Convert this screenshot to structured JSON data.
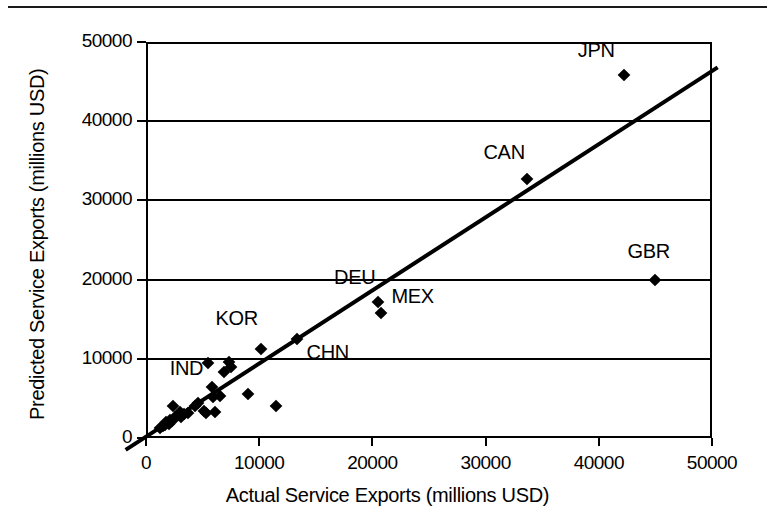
{
  "chart_data": {
    "type": "scatter",
    "title": "",
    "xlabel": "Actual Service Exports (millions USD)",
    "ylabel": "Predicted Service Exports (millions USD)",
    "xlim": [
      0,
      50000
    ],
    "ylim": [
      0,
      50000
    ],
    "xticks": [
      0,
      10000,
      20000,
      30000,
      40000,
      50000
    ],
    "yticks": [
      0,
      10000,
      20000,
      30000,
      40000,
      50000
    ],
    "xtick_labels": [
      "0",
      "10000",
      "20000",
      "30000",
      "40000",
      "50000"
    ],
    "ytick_labels": [
      "0",
      "10000",
      "20000",
      "30000",
      "40000",
      "50000"
    ],
    "grid": "horizontal",
    "legend": "none",
    "marker": "filled-diamond",
    "marker_color": "#000000",
    "fit_line": {
      "label": "identity/regression line",
      "color": "#000000",
      "width": 4,
      "x_start": -1800,
      "y_start": -1500,
      "x_end": 50500,
      "y_end": 46800
    },
    "labeled_points": [
      {
        "label": "JPN",
        "x": 42200,
        "y": 45800,
        "label_dx": -46,
        "label_dy": -24
      },
      {
        "label": "CAN",
        "x": 33700,
        "y": 32700,
        "label_dx": -44,
        "label_dy": -26
      },
      {
        "label": "GBR",
        "x": 45000,
        "y": 20000,
        "label_dx": -28,
        "label_dy": -28
      },
      {
        "label": "DEU",
        "x": 20500,
        "y": 17200,
        "label_dx": -44,
        "label_dy": -24
      },
      {
        "label": "MEX",
        "x": 20800,
        "y": 15800,
        "label_dx": 10,
        "label_dy": -16
      },
      {
        "label": "CHN",
        "x": 13300,
        "y": 12500,
        "label_dx": 10,
        "label_dy": 14
      },
      {
        "label": "KOR",
        "x": 10200,
        "y": 11200,
        "label_dx": -46,
        "label_dy": -30
      },
      {
        "label": "IND",
        "x": 5800,
        "y": 6500,
        "label_dx": -42,
        "label_dy": -18
      }
    ],
    "unlabeled_points": [
      {
        "x": 1200,
        "y": 1300
      },
      {
        "x": 1500,
        "y": 1500
      },
      {
        "x": 1700,
        "y": 1600
      },
      {
        "x": 1800,
        "y": 2000
      },
      {
        "x": 2000,
        "y": 1800
      },
      {
        "x": 2100,
        "y": 2300
      },
      {
        "x": 2300,
        "y": 2100
      },
      {
        "x": 2400,
        "y": 4000
      },
      {
        "x": 2600,
        "y": 2600
      },
      {
        "x": 2800,
        "y": 2900
      },
      {
        "x": 3000,
        "y": 3300
      },
      {
        "x": 3100,
        "y": 2700
      },
      {
        "x": 3400,
        "y": 3000
      },
      {
        "x": 3700,
        "y": 3100
      },
      {
        "x": 4300,
        "y": 4000
      },
      {
        "x": 4600,
        "y": 4400
      },
      {
        "x": 5100,
        "y": 3400
      },
      {
        "x": 5300,
        "y": 3200
      },
      {
        "x": 5500,
        "y": 9500
      },
      {
        "x": 5900,
        "y": 5200
      },
      {
        "x": 6100,
        "y": 3300
      },
      {
        "x": 6500,
        "y": 5300
      },
      {
        "x": 6900,
        "y": 8300
      },
      {
        "x": 7300,
        "y": 9600
      },
      {
        "x": 7500,
        "y": 9000
      },
      {
        "x": 9000,
        "y": 5500
      },
      {
        "x": 11500,
        "y": 4000
      }
    ]
  }
}
